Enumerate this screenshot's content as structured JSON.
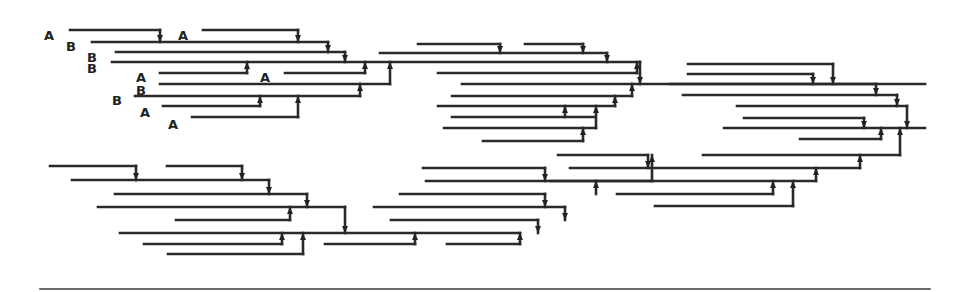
{
  "diagram": {
    "colors": {
      "line": "#2a2a2a",
      "background": "#ffffff"
    },
    "labels": [
      {
        "text": "A",
        "x": 54,
        "y": 35
      },
      {
        "text": "B",
        "x": 76,
        "y": 46
      },
      {
        "text": "B",
        "x": 97,
        "y": 57
      },
      {
        "text": "B",
        "x": 97,
        "y": 68
      },
      {
        "text": "A",
        "x": 146,
        "y": 77
      },
      {
        "text": "B",
        "x": 146,
        "y": 90
      },
      {
        "text": "B",
        "x": 122,
        "y": 100
      },
      {
        "text": "A",
        "x": 150,
        "y": 112
      },
      {
        "text": "A",
        "x": 178,
        "y": 124
      },
      {
        "text": "A",
        "x": 188,
        "y": 35
      },
      {
        "text": "A",
        "x": 270,
        "y": 77
      }
    ],
    "segments": [
      {
        "y": 30,
        "x1": 70,
        "x2": 160
      },
      {
        "y": 30,
        "x1": 203,
        "x2": 298
      },
      {
        "y": 42,
        "x1": 92,
        "x2": 328
      },
      {
        "y": 52,
        "x1": 116,
        "x2": 345
      },
      {
        "y": 62,
        "x1": 112,
        "x2": 640
      },
      {
        "y": 73,
        "x1": 160,
        "x2": 247
      },
      {
        "y": 73,
        "x1": 285,
        "x2": 365
      },
      {
        "y": 84,
        "x1": 160,
        "x2": 390
      },
      {
        "y": 96,
        "x1": 135,
        "x2": 360
      },
      {
        "y": 106,
        "x1": 163,
        "x2": 260
      },
      {
        "y": 117,
        "x1": 192,
        "x2": 298
      },
      {
        "y": 44,
        "x1": 418,
        "x2": 500
      },
      {
        "y": 44,
        "x1": 525,
        "x2": 583
      },
      {
        "y": 53,
        "x1": 380,
        "x2": 607
      },
      {
        "y": 73,
        "x1": 438,
        "x2": 637
      },
      {
        "y": 84,
        "x1": 462,
        "x2": 925
      },
      {
        "y": 96,
        "x1": 452,
        "x2": 632
      },
      {
        "y": 106,
        "x1": 438,
        "x2": 615
      },
      {
        "y": 117,
        "x1": 452,
        "x2": 595
      },
      {
        "y": 128,
        "x1": 444,
        "x2": 596
      },
      {
        "y": 141,
        "x1": 483,
        "x2": 583
      },
      {
        "y": 64,
        "x1": 688,
        "x2": 833
      },
      {
        "y": 74,
        "x1": 688,
        "x2": 813
      },
      {
        "y": 84,
        "x1": 670,
        "x2": 876
      },
      {
        "y": 95,
        "x1": 683,
        "x2": 897
      },
      {
        "y": 106,
        "x1": 737,
        "x2": 907
      },
      {
        "y": 118,
        "x1": 744,
        "x2": 864
      },
      {
        "y": 128,
        "x1": 724,
        "x2": 925
      },
      {
        "y": 139,
        "x1": 800,
        "x2": 881
      },
      {
        "y": 166,
        "x1": 50,
        "x2": 136
      },
      {
        "y": 166,
        "x1": 167,
        "x2": 242
      },
      {
        "y": 180,
        "x1": 72,
        "x2": 269
      },
      {
        "y": 194,
        "x1": 115,
        "x2": 307
      },
      {
        "y": 207,
        "x1": 98,
        "x2": 345
      },
      {
        "y": 220,
        "x1": 176,
        "x2": 290
      },
      {
        "y": 233,
        "x1": 120,
        "x2": 520
      },
      {
        "y": 244,
        "x1": 144,
        "x2": 282
      },
      {
        "y": 254,
        "x1": 168,
        "x2": 303
      },
      {
        "y": 244,
        "x1": 325,
        "x2": 415
      },
      {
        "y": 244,
        "x1": 447,
        "x2": 520
      },
      {
        "y": 168,
        "x1": 423,
        "x2": 545
      },
      {
        "y": 181,
        "x1": 426,
        "x2": 652
      },
      {
        "y": 194,
        "x1": 400,
        "x2": 545
      },
      {
        "y": 207,
        "x1": 374,
        "x2": 565
      },
      {
        "y": 220,
        "x1": 391,
        "x2": 538
      },
      {
        "y": 155,
        "x1": 558,
        "x2": 648
      },
      {
        "y": 155,
        "x1": 703,
        "x2": 900
      },
      {
        "y": 168,
        "x1": 570,
        "x2": 860
      },
      {
        "y": 181,
        "x1": 550,
        "x2": 816
      },
      {
        "y": 194,
        "x1": 617,
        "x2": 773
      },
      {
        "y": 206,
        "x1": 655,
        "x2": 793
      }
    ],
    "connectors": [
      {
        "x": 160,
        "y1": 30,
        "y2": 42,
        "dir": "down"
      },
      {
        "x": 298,
        "y1": 30,
        "y2": 42,
        "dir": "down"
      },
      {
        "x": 328,
        "y1": 42,
        "y2": 52,
        "dir": "down"
      },
      {
        "x": 345,
        "y1": 52,
        "y2": 62,
        "dir": "down"
      },
      {
        "x": 247,
        "y1": 73,
        "y2": 62,
        "dir": "up"
      },
      {
        "x": 365,
        "y1": 73,
        "y2": 62,
        "dir": "up"
      },
      {
        "x": 390,
        "y1": 84,
        "y2": 62,
        "dir": "up"
      },
      {
        "x": 360,
        "y1": 96,
        "y2": 84,
        "dir": "up"
      },
      {
        "x": 260,
        "y1": 106,
        "y2": 96,
        "dir": "up"
      },
      {
        "x": 298,
        "y1": 117,
        "y2": 96,
        "dir": "up"
      },
      {
        "x": 500,
        "y1": 44,
        "y2": 53,
        "dir": "down"
      },
      {
        "x": 583,
        "y1": 44,
        "y2": 53,
        "dir": "down"
      },
      {
        "x": 607,
        "y1": 53,
        "y2": 62,
        "dir": "down"
      },
      {
        "x": 637,
        "y1": 73,
        "y2": 62,
        "dir": "up"
      },
      {
        "x": 640,
        "y1": 62,
        "y2": 84,
        "dir": "down"
      },
      {
        "x": 632,
        "y1": 96,
        "y2": 84,
        "dir": "up"
      },
      {
        "x": 615,
        "y1": 106,
        "y2": 96,
        "dir": "up"
      },
      {
        "x": 565,
        "y1": 117,
        "y2": 106,
        "dir": "up"
      },
      {
        "x": 596,
        "y1": 128,
        "y2": 106,
        "dir": "up"
      },
      {
        "x": 583,
        "y1": 141,
        "y2": 128,
        "dir": "up"
      },
      {
        "x": 833,
        "y1": 64,
        "y2": 84,
        "dir": "down"
      },
      {
        "x": 813,
        "y1": 74,
        "y2": 84,
        "dir": "down"
      },
      {
        "x": 876,
        "y1": 84,
        "y2": 95,
        "dir": "down"
      },
      {
        "x": 897,
        "y1": 95,
        "y2": 106,
        "dir": "down"
      },
      {
        "x": 907,
        "y1": 106,
        "y2": 128,
        "dir": "down"
      },
      {
        "x": 864,
        "y1": 118,
        "y2": 128,
        "dir": "down"
      },
      {
        "x": 881,
        "y1": 139,
        "y2": 128,
        "dir": "up"
      },
      {
        "x": 900,
        "y1": 155,
        "y2": 128,
        "dir": "up"
      },
      {
        "x": 136,
        "y1": 166,
        "y2": 180,
        "dir": "down"
      },
      {
        "x": 242,
        "y1": 166,
        "y2": 180,
        "dir": "down"
      },
      {
        "x": 269,
        "y1": 180,
        "y2": 194,
        "dir": "down"
      },
      {
        "x": 307,
        "y1": 194,
        "y2": 207,
        "dir": "down"
      },
      {
        "x": 290,
        "y1": 220,
        "y2": 207,
        "dir": "up"
      },
      {
        "x": 345,
        "y1": 207,
        "y2": 233,
        "dir": "down"
      },
      {
        "x": 282,
        "y1": 244,
        "y2": 233,
        "dir": "up"
      },
      {
        "x": 303,
        "y1": 254,
        "y2": 233,
        "dir": "up"
      },
      {
        "x": 415,
        "y1": 244,
        "y2": 233,
        "dir": "up"
      },
      {
        "x": 520,
        "y1": 244,
        "y2": 233,
        "dir": "up"
      },
      {
        "x": 538,
        "y1": 220,
        "y2": 233,
        "dir": "up"
      },
      {
        "x": 545,
        "y1": 168,
        "y2": 181,
        "dir": "down"
      },
      {
        "x": 545,
        "y1": 194,
        "y2": 207,
        "dir": "down"
      },
      {
        "x": 565,
        "y1": 207,
        "y2": 220,
        "dir": "up"
      },
      {
        "x": 652,
        "y1": 181,
        "y2": 155,
        "dir": "up"
      },
      {
        "x": 648,
        "y1": 155,
        "y2": 168,
        "dir": "down"
      },
      {
        "x": 860,
        "y1": 168,
        "y2": 155,
        "dir": "up"
      },
      {
        "x": 816,
        "y1": 181,
        "y2": 168,
        "dir": "up"
      },
      {
        "x": 596,
        "y1": 194,
        "y2": 181,
        "dir": "up"
      },
      {
        "x": 773,
        "y1": 194,
        "y2": 181,
        "dir": "up"
      },
      {
        "x": 793,
        "y1": 206,
        "y2": 181,
        "dir": "up"
      }
    ],
    "baseline": {
      "y": 289,
      "x1": 40,
      "x2": 930
    }
  }
}
